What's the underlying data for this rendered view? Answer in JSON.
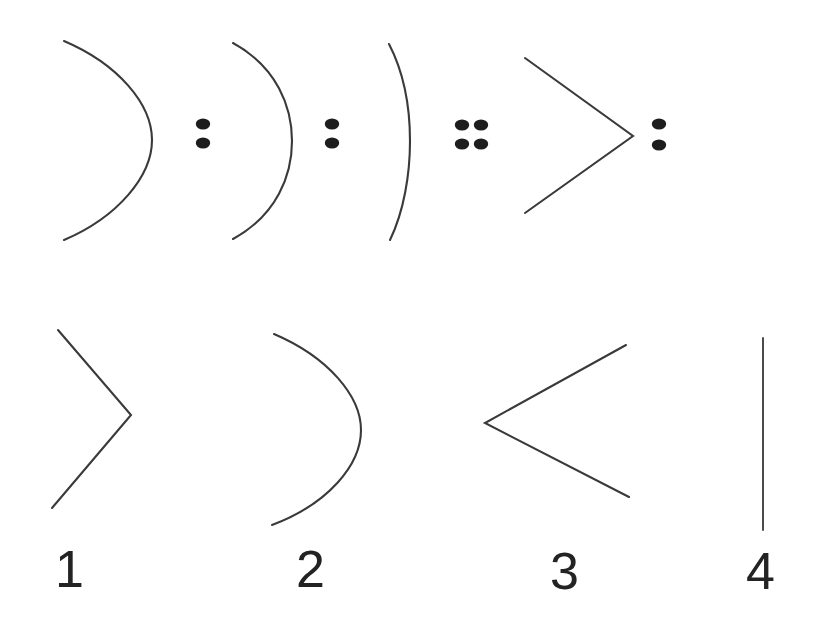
{
  "page": {
    "background_color": "#ffffff",
    "ink_color": "#3a3a3a",
    "dot_color": "#1d1d1d",
    "numeral_color": "#232323",
    "width": 821,
    "height": 636
  },
  "puzzle": {
    "type": "visual-sequence-analogy",
    "prompt_row": {
      "name": "sequence-row",
      "items": [
        {
          "index": 1,
          "kind": "arc",
          "glyph": ")",
          "description": "deep right-opening arc",
          "curvature": "deep",
          "bbox": [
            62,
            40,
            90,
            200
          ]
        },
        {
          "index": 2,
          "kind": "separator",
          "glyph": ":",
          "description": "two dots stacked vertically",
          "dot_count": 2,
          "dot_layout": "1x2",
          "bbox": [
            196,
            116,
            14,
            34
          ]
        },
        {
          "index": 3,
          "kind": "arc",
          "glyph": ")",
          "description": "medium right-opening arc",
          "curvature": "medium",
          "bbox": [
            230,
            42,
            62,
            198
          ]
        },
        {
          "index": 4,
          "kind": "separator",
          "glyph": ":",
          "description": "two dots stacked vertically",
          "dot_count": 2,
          "dot_layout": "1x2",
          "bbox": [
            325,
            116,
            14,
            34
          ]
        },
        {
          "index": 5,
          "kind": "arc",
          "glyph": ")",
          "description": "shallow right-opening arc, nearly straight",
          "curvature": "shallow",
          "bbox": [
            388,
            44,
            22,
            196
          ]
        },
        {
          "index": 6,
          "kind": "separator",
          "glyph": "::",
          "description": "four dots in a 2 by 2 block",
          "dot_count": 4,
          "dot_layout": "2x2",
          "bbox": [
            455,
            116,
            32,
            34
          ]
        },
        {
          "index": 7,
          "kind": "chevron",
          "glyph": ">",
          "description": "right-pointing chevron",
          "bbox": [
            525,
            58,
            108,
            155
          ]
        },
        {
          "index": 8,
          "kind": "separator",
          "glyph": ":",
          "description": "two dots stacked vertically",
          "dot_count": 2,
          "dot_layout": "1x2",
          "bbox": [
            652,
            116,
            14,
            34
          ]
        }
      ]
    },
    "options_row": {
      "name": "answer-options-row",
      "options": [
        {
          "label": "1",
          "kind": "chevron",
          "glyph": ">",
          "description": "right-pointing chevron",
          "bbox": [
            52,
            330,
            80,
            180
          ],
          "label_pos": [
            55,
            543
          ]
        },
        {
          "label": "2",
          "kind": "arc",
          "glyph": ")",
          "description": "deep right-opening arc",
          "bbox": [
            272,
            333,
            90,
            193
          ],
          "label_pos": [
            296,
            543
          ]
        },
        {
          "label": "3",
          "kind": "chevron",
          "glyph": "<",
          "description": "left-pointing chevron",
          "bbox": [
            485,
            345,
            145,
            153
          ],
          "label_pos": [
            550,
            545
          ]
        },
        {
          "label": "4",
          "kind": "line",
          "glyph": "|",
          "description": "vertical straight line",
          "bbox": [
            763,
            338,
            1,
            192
          ],
          "label_pos": [
            746,
            545
          ]
        }
      ]
    }
  }
}
